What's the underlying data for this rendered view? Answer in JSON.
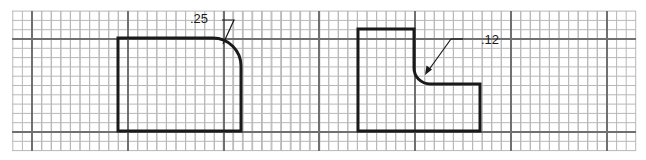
{
  "figure": {
    "width": 646,
    "height": 160,
    "background": "#ffffff",
    "grid": {
      "x0": 12,
      "y0": 11,
      "x1": 636,
      "y1": 151,
      "cell": 9.58,
      "cell_y": 9.3,
      "major_x": [
        32,
        128,
        224,
        319,
        415,
        511,
        607
      ],
      "major_y": [
        39,
        132
      ],
      "minor_color": "#b8b8b8",
      "major_color": "#707070"
    },
    "shape_color": "#1a1a1a"
  },
  "shapes": [
    {
      "name": "rounded-corner-rectangle",
      "description": "Rectangle with a rounded (convex) top-right corner",
      "radius_label": ".25"
    },
    {
      "name": "l-shape-with-fillet",
      "description": "L-shaped block with a concave inside fillet",
      "radius_label": ".12"
    }
  ],
  "annotations": [
    {
      "text": ".25",
      "x": 190,
      "y": 12
    },
    {
      "text": ".12",
      "x": 481,
      "y": 33
    }
  ]
}
